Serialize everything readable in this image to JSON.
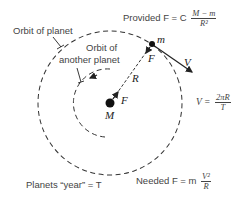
{
  "diagram": {
    "labels": {
      "orbit_of_planet": "Orbit of planet",
      "orbit_of_another_planet_line1": "Orbit of",
      "orbit_of_another_planet_line2": "another planet",
      "planets_year": "Planets “year” = T",
      "provided_force": {
        "prefix": "Provided F = C",
        "numerator": "M − m",
        "denominator": "R²"
      },
      "velocity_eq": {
        "prefix": "V =",
        "numerator": "2πR",
        "denominator": "T"
      },
      "needed_force": {
        "prefix": "Needed F = m",
        "numerator": "V²",
        "denominator": "R"
      }
    },
    "symbols": {
      "central_mass": "M",
      "planet_mass": "m",
      "force_on_planet": "F",
      "force_on_sun": "F",
      "radius": "R",
      "velocity": "V"
    },
    "colors": {
      "ink": "#222222",
      "text": "#444444",
      "background": "#ffffff"
    }
  }
}
